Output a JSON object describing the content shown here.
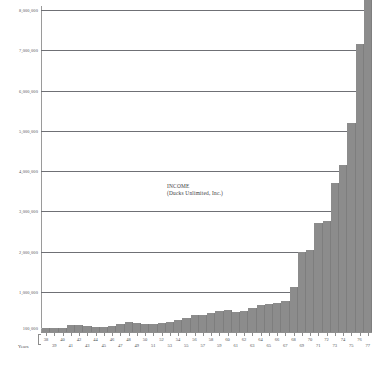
{
  "chart_data": {
    "type": "bar",
    "title": "INCOME",
    "subtitle": "(Ducks Unlimited, Inc.)",
    "xlabel": "Years",
    "ylabel": "",
    "ylim": [
      0,
      8100000
    ],
    "grid": true,
    "legend": null,
    "ytick_labels": [
      "8,000,000",
      "7,000,000",
      "6,000,000",
      "5,000,000",
      "4,000,000",
      "3,000,000",
      "2,000,000",
      "1,000,000",
      "100,000"
    ],
    "ytick_values": [
      8000000,
      7000000,
      6000000,
      5000000,
      4000000,
      3000000,
      2000000,
      1000000,
      100000
    ],
    "categories": [
      "38",
      "39",
      "40",
      "41",
      "42",
      "43",
      "44",
      "45",
      "46",
      "47",
      "48",
      "49",
      "50",
      "51",
      "52",
      "53",
      "54",
      "55",
      "56",
      "57",
      "58",
      "59",
      "60",
      "61",
      "62",
      "63",
      "64",
      "65",
      "66",
      "67",
      "68",
      "69",
      "70",
      "71",
      "72",
      "73",
      "74",
      "75",
      "76",
      "77"
    ],
    "values": [
      90000,
      95000,
      110000,
      180000,
      175000,
      140000,
      130000,
      135000,
      160000,
      200000,
      240000,
      225000,
      210000,
      200000,
      215000,
      260000,
      300000,
      360000,
      420000,
      430000,
      470000,
      520000,
      545000,
      500000,
      520000,
      600000,
      680000,
      700000,
      720000,
      760000,
      1120000,
      2000000,
      2030000,
      2700000,
      2750000,
      3700000,
      4150000,
      5200000,
      7150000,
      8400000
    ],
    "series_label": "INCOME"
  },
  "axis": {
    "years_caption": "Years",
    "xlabels_row1": [
      "38",
      "40",
      "42",
      "44",
      "46",
      "48",
      "50",
      "52",
      "54",
      "56",
      "58",
      "60",
      "62",
      "64",
      "66",
      "68",
      "70",
      "72",
      "74",
      "76"
    ],
    "xlabels_row2": [
      "39",
      "41",
      "43",
      "45",
      "47",
      "49",
      "51",
      "53",
      "55",
      "57",
      "59",
      "61",
      "63",
      "65",
      "67",
      "69",
      "71",
      "73",
      "75",
      "77"
    ]
  },
  "style": {
    "bar_color": "#8c8c8c",
    "grid_color": "#6f7075",
    "text_color": "#4e4f53",
    "background": "#ffffff"
  },
  "caption": {
    "text": ""
  }
}
